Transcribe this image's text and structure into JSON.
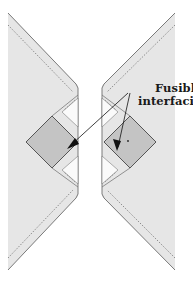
{
  "diagram": {
    "label": {
      "line1": "Fusible",
      "line2": "interfacing"
    },
    "colors": {
      "background": "#ffffff",
      "fabric_fill": "#e6e6e6",
      "fabric_edge": "#7a7a7a",
      "strip_fill": "#f3f3f3",
      "interfacing_fill": "#c4c4c4",
      "interfacing_edge": "#555555",
      "stitch_line": "#666666",
      "arrow": "#111111",
      "label_text": "#1a1a1a"
    },
    "parts": [
      {
        "name": "left-fabric-piece",
        "description": "Left fabric panel with mitered corner"
      },
      {
        "name": "right-fabric-piece",
        "description": "Right fabric panel with mitered corner"
      },
      {
        "name": "left-interfacing-square",
        "description": "Fusible interfacing square on left piece"
      },
      {
        "name": "right-interfacing-square",
        "description": "Fusible interfacing square on right piece"
      }
    ]
  }
}
